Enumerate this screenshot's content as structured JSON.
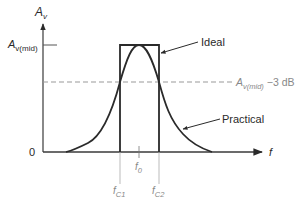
{
  "diagram": {
    "y_axis": {
      "symbol": "A",
      "subscript": "v"
    },
    "x_axis": {
      "symbol": "f"
    },
    "origin_label": "0",
    "mid_label": {
      "symbol": "A",
      "subscript": "v(mid)"
    },
    "cutoff_line_label": {
      "symbol": "A",
      "subscript": "v(mid)",
      "suffix": " −3 dB"
    },
    "callouts": {
      "ideal": "Ideal",
      "practical": "Practical"
    },
    "freq_labels": {
      "f0": {
        "symbol": "f",
        "subscript": "0"
      },
      "fc1": {
        "symbol": "f",
        "subscript": "C1"
      },
      "fc2": {
        "symbol": "f",
        "subscript": "C2"
      }
    },
    "colors": {
      "curve": "#2a2a2a",
      "axis": "#3a3a3a",
      "dashed": "#999999",
      "guide": "#aaaaaa"
    }
  }
}
